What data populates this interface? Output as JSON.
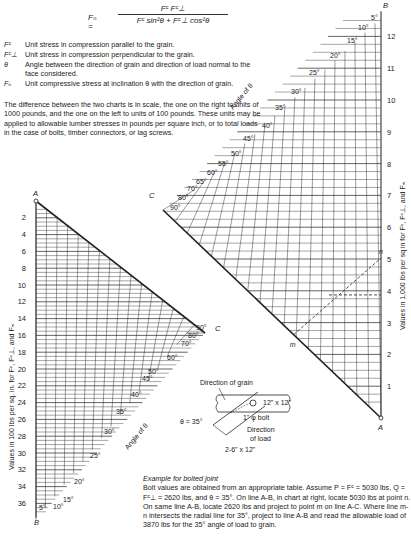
{
  "formula": {
    "lhs": "Fₙ =",
    "numerator": "Fᶜ Fᶜ⊥",
    "denominator": "Fᶜ sin²θ + Fᶜ⊥ cos²θ"
  },
  "definitions": [
    {
      "symbol": "Fᶜ",
      "text": "Unit stress in compression parallel to the grain."
    },
    {
      "symbol": "Fᶜ⊥",
      "text": "Unit stress in compression perpendicular to the grain."
    },
    {
      "symbol": "θ",
      "text": "Angle between the direction of grain and direction of load normal to the face considered."
    },
    {
      "symbol": "Fₙ",
      "text": "Unit compressive stress at inclination θ with the direction of grain."
    }
  ],
  "description": "The difference between the two charts is in scale, the one on the right to units of 1000 pounds, and the one on the left to units of 100 pounds. These units may be applied to allowable lumber stresses in pounds per square inch, or to total loads in the case of bolts, timber connectors, or lag screws.",
  "left_chart": {
    "axis_label": "Values in 100 lbs per sq. in. for Fᶜ, Fᶜ⊥, and Fₙ",
    "point_A": "A",
    "point_B": "B",
    "point_C": "C",
    "ticks": [
      "2",
      "4",
      "6",
      "8",
      "10",
      "12",
      "14",
      "16",
      "18",
      "20",
      "22",
      "24",
      "26",
      "28",
      "30",
      "32",
      "34",
      "36"
    ],
    "angle_label": "Angle of θ",
    "angles": [
      "5°",
      "10°",
      "15°",
      "20°",
      "25°",
      "30°",
      "35°",
      "40°",
      "45°",
      "50°",
      "60°",
      "70°",
      "80°",
      "90°"
    ]
  },
  "right_chart": {
    "axis_label": "Values in 1,000 lbs per sq in for Fᶜ, Fᶜ⊥, and Fₙ",
    "point_A": "A",
    "point_B": "B",
    "point_C": "C",
    "point_m": "m",
    "point_n": "n",
    "ticks": [
      "1",
      "2",
      "3",
      "4",
      "5",
      "6",
      "7",
      "8",
      "9",
      "10",
      "11",
      "12"
    ],
    "angle_label": "Angle of θ",
    "angles": [
      "5°",
      "10°",
      "15°",
      "20°",
      "25°",
      "30°",
      "35°",
      "40°",
      "45°",
      "50°",
      "55°",
      "60°",
      "65°",
      "70°",
      "80°",
      "90°"
    ]
  },
  "joint_sketch": {
    "direction_of_grain": "Direction of grain",
    "theta": "θ = 35°",
    "main_member": "12\" x 12\"",
    "bolt": "1\" φ bolt",
    "direction_of_load_1": "Direction",
    "direction_of_load_2": "of load",
    "side_member": "2-6\" x 12\""
  },
  "example": {
    "title": "Example for bolted joint",
    "text": "Bolt values are obtained from an appropriate table. Assume P = Fᶜ = 5030 lbs, Q = Fᶜ⊥ = 2620 lbs, and θ = 35°. On line A-B, in chart at right, locate 5030 lbs at point n. On same line A-B, locate 2620 lbs and project to point m on line A-C. Where line m-n intersects the radial line for 35°, project to line A-B and read the allowable load of 3870 lbs for the 35° angle of load to grain."
  },
  "colors": {
    "ink": "#222222",
    "background": "#ffffff"
  }
}
